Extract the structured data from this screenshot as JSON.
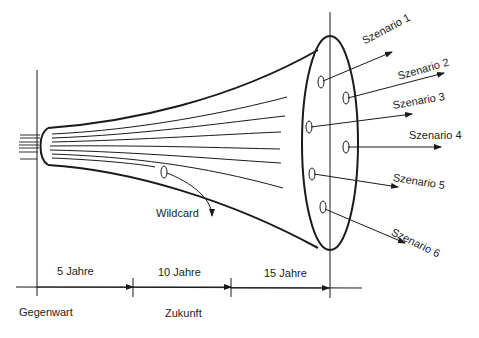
{
  "diagram": {
    "type": "scenario-funnel",
    "scenarios": [
      {
        "label": "Szenario 1"
      },
      {
        "label": "Szenario 2"
      },
      {
        "label": "Szenario 3"
      },
      {
        "label": "Szenario 4"
      },
      {
        "label": "Szenario 5"
      },
      {
        "label": "Szenario 6"
      }
    ],
    "wildcard": {
      "label": "Wildcard"
    },
    "timeline": {
      "segments": [
        {
          "label": "5 Jahre"
        },
        {
          "label": "10 Jahre"
        },
        {
          "label": "15 Jahre"
        }
      ],
      "present_label": "Gegenwart",
      "future_label": "Zukunft"
    },
    "colors": {
      "line": "#1a1a1a",
      "background": "#ffffff"
    }
  }
}
